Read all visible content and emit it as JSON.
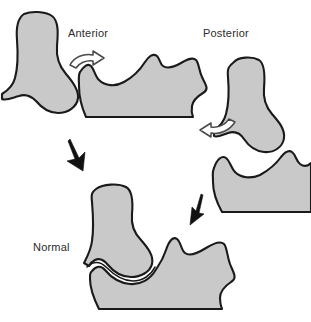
{
  "figure": {
    "background_color": "#ffffff",
    "bone_fill_color": "#c9c9c9",
    "bone_outline_color": "#1a1a1a",
    "label_text_color": "#2b2b2b",
    "width_px": 311,
    "height_px": 322
  },
  "labels": {
    "anterior": "Anterior",
    "posterior": "Posterior",
    "normal": "Normal"
  },
  "panels": [
    {
      "id": "anterior-panel",
      "label": "Anterior",
      "position": "top-left",
      "bones": [
        "humerus-distal",
        "ulna-proximal"
      ],
      "motion_arrow": "hollow-arrow-right"
    },
    {
      "id": "posterior-panel",
      "label": "Posterior",
      "position": "top-right",
      "bones": [
        "humerus-distal",
        "ulna-proximal"
      ],
      "motion_arrow": "hollow-arrow-left"
    },
    {
      "id": "normal-panel",
      "label": "Normal",
      "position": "bottom-center",
      "bones": [
        "humerus-distal",
        "ulna-proximal"
      ],
      "motion_arrow": null
    }
  ],
  "arrows": [
    {
      "name": "hollow-arrow-right",
      "style": "hollow-curved",
      "direction": "right",
      "meaning": "anterior displacement direction"
    },
    {
      "name": "hollow-arrow-left",
      "style": "hollow-curved",
      "direction": "left",
      "meaning": "posterior displacement direction"
    },
    {
      "name": "solid-arrow-down-left",
      "style": "solid",
      "direction": "down",
      "meaning": "reduction to normal from anterior"
    },
    {
      "name": "solid-arrow-down-right",
      "style": "solid",
      "direction": "down",
      "meaning": "reduction to normal from posterior"
    }
  ]
}
